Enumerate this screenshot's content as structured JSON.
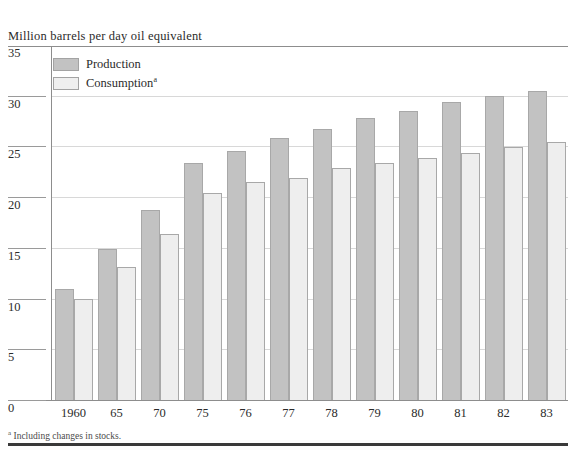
{
  "chart_data": {
    "type": "bar",
    "title": "",
    "ylabel": "Million barrels per day oil equivalent",
    "xlabel": "",
    "ylim": [
      0,
      35
    ],
    "yticks": [
      0,
      5,
      10,
      15,
      20,
      25,
      30,
      35
    ],
    "grid": true,
    "legend_position": "top-left",
    "categories": [
      "1960",
      "65",
      "70",
      "75",
      "76",
      "77",
      "78",
      "79",
      "80",
      "81",
      "82",
      "83"
    ],
    "series": [
      {
        "name": "Production",
        "color": "#c2c2c2",
        "values": [
          10.9,
          14.9,
          18.7,
          23.4,
          24.6,
          25.8,
          26.7,
          27.8,
          28.5,
          29.4,
          30.0,
          30.5
        ]
      },
      {
        "name": "Consumption",
        "color": "#eeeeee",
        "values": [
          10.0,
          13.1,
          16.4,
          20.4,
          21.5,
          21.9,
          22.9,
          23.4,
          23.9,
          24.4,
          24.9,
          25.4
        ]
      }
    ],
    "annotations": [
      "a Including changes in stocks."
    ]
  },
  "axis": {
    "title": "Million barrels per day oil equivalent",
    "ticks": [
      "35",
      "30",
      "25",
      "20",
      "15",
      "10",
      "5",
      "0"
    ]
  },
  "legend": {
    "items": [
      {
        "label": "Production",
        "marker": "filled-gray-swatch"
      },
      {
        "label": "Consumption",
        "marker": "outline-white-swatch",
        "footnote_marker": "a"
      }
    ]
  },
  "footnote": {
    "marker": "a",
    "text": "Including changes in stocks."
  },
  "colors": {
    "production": "#c2c2c2",
    "consumption": "#eeeeee",
    "border": "#a8a8a8",
    "rule": "#8d8d8d",
    "text": "#2b2b2b"
  }
}
